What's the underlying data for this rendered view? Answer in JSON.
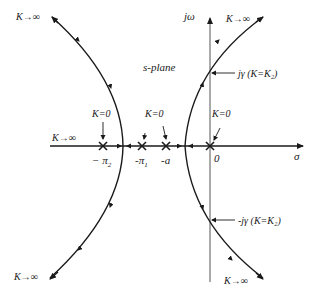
{
  "diagram": {
    "type": "root-locus",
    "plane_label": "s-plane",
    "axes": {
      "real_axis_label": "σ",
      "imag_axis_label": "jω",
      "origin_label": "0"
    },
    "poles": [
      {
        "label": "−π₂",
        "label_text": "− π",
        "sub": "2",
        "k_label": "K=0"
      },
      {
        "label": "−π₁",
        "label_text": "-π",
        "sub": "1",
        "k_label": "K=0"
      },
      {
        "label": "−a",
        "label_text": "-a",
        "k_label": ""
      },
      {
        "label": "0",
        "label_text": "0",
        "k_label": "K=0"
      }
    ],
    "asymptote_labels": {
      "top_left": "K→∞",
      "top_right": "K→∞",
      "bottom_left": "K→∞",
      "bottom_right": "K→∞",
      "real_axis_left": "K→∞"
    },
    "crossings": {
      "upper": "jγ (K=K₂)",
      "lower": "-jγ (K=K₂)"
    },
    "colors": {
      "line": "#1a1a1a",
      "background": "#ffffff"
    }
  }
}
